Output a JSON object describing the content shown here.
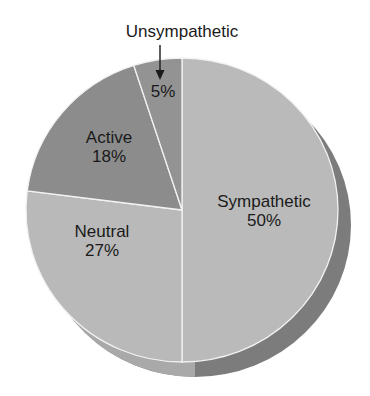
{
  "chart_data": {
    "type": "pie",
    "title": "",
    "categories": [
      "Sympathetic",
      "Neutral",
      "Active",
      "Unsympathetic"
    ],
    "values": [
      50,
      27,
      18,
      5
    ],
    "unit": "%",
    "labels": [
      {
        "name": "Sympathetic",
        "value_label": "50%"
      },
      {
        "name": "Neutral",
        "value_label": "27%"
      },
      {
        "name": "Active",
        "value_label": "18%"
      },
      {
        "name": "Unsympathetic",
        "value_label": "5%"
      }
    ],
    "colors": {
      "Sympathetic": "#bababa",
      "Neutral": "#b9b9b9",
      "Active": "#8c8c8c",
      "Unsympathetic": "#939393"
    },
    "depth_colors": {
      "right": "#7c7c7c",
      "left": "#a9a9a9"
    },
    "annotations": [
      {
        "text": "Unsympathetic",
        "arrow_to": "Unsympathetic slice"
      }
    ],
    "legend": "none (direct labels)",
    "style": "3D pie, greyscale"
  }
}
